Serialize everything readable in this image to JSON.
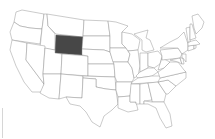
{
  "map": {
    "title": "United States map",
    "highlighted_state": "Wyoming",
    "colors": {
      "highlight_fill": "#474747",
      "state_fill": "#ffffff",
      "border": "#8a8a8a",
      "background": "#ffffff"
    },
    "states": [
      {
        "name": "Washington",
        "highlighted": false
      },
      {
        "name": "Oregon",
        "highlighted": false
      },
      {
        "name": "California",
        "highlighted": false
      },
      {
        "name": "Idaho",
        "highlighted": false
      },
      {
        "name": "Nevada",
        "highlighted": false
      },
      {
        "name": "Montana",
        "highlighted": false
      },
      {
        "name": "Wyoming",
        "highlighted": true
      },
      {
        "name": "Utah",
        "highlighted": false
      },
      {
        "name": "Arizona",
        "highlighted": false
      },
      {
        "name": "Colorado",
        "highlighted": false
      },
      {
        "name": "New Mexico",
        "highlighted": false
      },
      {
        "name": "North Dakota",
        "highlighted": false
      },
      {
        "name": "South Dakota",
        "highlighted": false
      },
      {
        "name": "Nebraska",
        "highlighted": false
      },
      {
        "name": "Kansas",
        "highlighted": false
      },
      {
        "name": "Oklahoma",
        "highlighted": false
      },
      {
        "name": "Texas",
        "highlighted": false
      },
      {
        "name": "Minnesota",
        "highlighted": false
      },
      {
        "name": "Iowa",
        "highlighted": false
      },
      {
        "name": "Missouri",
        "highlighted": false
      },
      {
        "name": "Arkansas",
        "highlighted": false
      },
      {
        "name": "Louisiana",
        "highlighted": false
      },
      {
        "name": "Wisconsin",
        "highlighted": false
      },
      {
        "name": "Illinois",
        "highlighted": false
      },
      {
        "name": "Michigan",
        "highlighted": false
      },
      {
        "name": "Indiana",
        "highlighted": false
      },
      {
        "name": "Ohio",
        "highlighted": false
      },
      {
        "name": "Kentucky",
        "highlighted": false
      },
      {
        "name": "Tennessee",
        "highlighted": false
      },
      {
        "name": "Mississippi",
        "highlighted": false
      },
      {
        "name": "Alabama",
        "highlighted": false
      },
      {
        "name": "Georgia",
        "highlighted": false
      },
      {
        "name": "Florida",
        "highlighted": false
      },
      {
        "name": "South Carolina",
        "highlighted": false
      },
      {
        "name": "North Carolina",
        "highlighted": false
      },
      {
        "name": "Virginia",
        "highlighted": false
      },
      {
        "name": "West Virginia",
        "highlighted": false
      },
      {
        "name": "Pennsylvania",
        "highlighted": false
      },
      {
        "name": "New York",
        "highlighted": false
      },
      {
        "name": "Maryland",
        "highlighted": false
      },
      {
        "name": "Delaware",
        "highlighted": false
      },
      {
        "name": "New Jersey",
        "highlighted": false
      },
      {
        "name": "Connecticut",
        "highlighted": false
      },
      {
        "name": "Rhode Island",
        "highlighted": false
      },
      {
        "name": "Massachusetts",
        "highlighted": false
      },
      {
        "name": "Vermont",
        "highlighted": false
      },
      {
        "name": "New Hampshire",
        "highlighted": false
      },
      {
        "name": "Maine",
        "highlighted": false
      }
    ]
  }
}
